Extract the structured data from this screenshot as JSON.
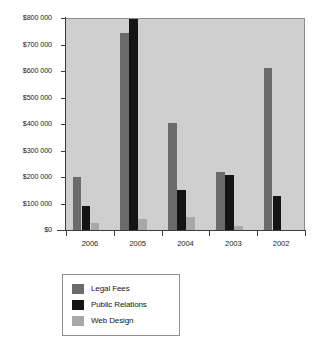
{
  "chart_data": {
    "type": "bar",
    "title": "",
    "subtitle": "",
    "xlabel": "",
    "ylabel": "",
    "categories": [
      "2006",
      "2005",
      "2004",
      "2003",
      "2002"
    ],
    "series": [
      {
        "name": "Legal Fees",
        "color": "#6b6b6b",
        "values": [
          200000,
          742000,
          402000,
          220000,
          610000
        ]
      },
      {
        "name": "Public Relations",
        "color": "#141414",
        "values": [
          92000,
          830000,
          152000,
          206000,
          128000
        ]
      },
      {
        "name": "Web Design",
        "color": "#a8a8a8",
        "values": [
          28000,
          42000,
          48000,
          16000,
          0
        ]
      }
    ],
    "ylim": [
      0,
      800000
    ],
    "y_ticks": [
      0,
      100000,
      200000,
      300000,
      400000,
      500000,
      600000,
      700000,
      800000
    ],
    "y_tick_labels": [
      "$0",
      "$100 000",
      "$200 000",
      "$300 000",
      "$400 000",
      "$500 000",
      "$600 000",
      "$700 000",
      "$800 000"
    ],
    "grid": false,
    "legend_position": "bottom-left"
  },
  "legend": {
    "items": [
      {
        "label": "Legal Fees",
        "swatch": "legal"
      },
      {
        "label": "Public Relations",
        "swatch": "pr"
      },
      {
        "label": "Web Design",
        "swatch": "web"
      }
    ]
  },
  "colors": {
    "plot_background": "#cfcfcf",
    "page_background": "#ffffff",
    "axis": "#3c3c3c",
    "legal_fees": "#6b6b6b",
    "public_relations": "#141414",
    "web_design": "#a8a8a8"
  }
}
